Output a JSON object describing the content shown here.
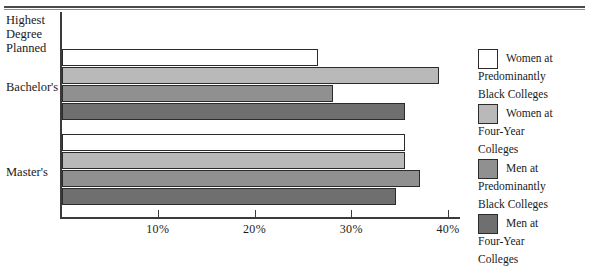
{
  "chart_data": {
    "type": "bar",
    "orientation": "horizontal",
    "title": "",
    "xlabel": "",
    "ylabel": "Highest Degree Planned",
    "categories": [
      "Bachelor's",
      "Master's"
    ],
    "series": [
      {
        "name": "Women at Predominantly Black Colleges",
        "color": "#ffffff",
        "values": [
          26.5,
          35.5
        ]
      },
      {
        "name": "Women at Four-Year Colleges",
        "color": "#b9b9b9",
        "values": [
          39.0,
          35.5
        ]
      },
      {
        "name": "Men at Predominantly Black Colleges",
        "color": "#909090",
        "values": [
          28.0,
          37.0
        ]
      },
      {
        "name": "Men at Four-Year Colleges",
        "color": "#6f6f6f",
        "values": [
          35.5,
          34.5
        ]
      }
    ],
    "xlim": [
      0,
      40
    ],
    "xticks": [
      10,
      20,
      30,
      40
    ],
    "xtick_labels": [
      "10%",
      "20%",
      "30%",
      "40%"
    ],
    "grid": false,
    "legend_position": "right"
  },
  "axis": {
    "y_title_line1": "Highest",
    "y_title_line2": "Degree",
    "y_title_line3": "Planned",
    "cat_bachelors": "Bachelor's",
    "cat_masters": "Master's",
    "tick_10": "10%",
    "tick_20": "20%",
    "tick_30": "30%",
    "tick_40": "40%"
  },
  "legend": {
    "items": [
      {
        "label": "Women at\nPredominantly\nBlack Colleges",
        "color": "#ffffff"
      },
      {
        "label": "Women at\nFour-Year\nColleges",
        "color": "#b9b9b9"
      },
      {
        "label": "Men at\nPredominantly\nBlack Colleges",
        "color": "#909090"
      },
      {
        "label": "Men at\nFour-Year\nColleges",
        "color": "#6f6f6f"
      }
    ]
  }
}
